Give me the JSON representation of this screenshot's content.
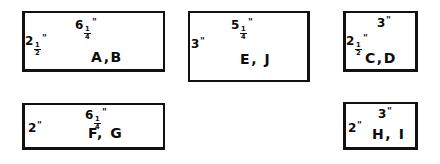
{
  "figure": {
    "ink_color": "#111111",
    "background_color": "#ffffff"
  },
  "rectangles": [
    {
      "id": "rect-ab",
      "names": "A,B",
      "top_label": {
        "whole": "6",
        "num": "1",
        "den": "4",
        "unit": "\""
      },
      "left_label": {
        "whole": "2",
        "num": "1",
        "den": "2",
        "unit": "\""
      },
      "width_in": 6.25,
      "height_in": 2.5
    },
    {
      "id": "rect-ej",
      "names": "E, J",
      "top_label": {
        "whole": "5",
        "num": "1",
        "den": "4",
        "unit": "\""
      },
      "left_label": {
        "whole": "3",
        "num": "",
        "den": "",
        "unit": "\""
      },
      "width_in": 5.25,
      "height_in": 3
    },
    {
      "id": "rect-cd",
      "names": "C,D",
      "top_label": {
        "whole": "3",
        "num": "",
        "den": "",
        "unit": "\""
      },
      "left_label": {
        "whole": "2",
        "num": "1",
        "den": "2",
        "unit": "\""
      },
      "width_in": 3,
      "height_in": 2.5
    },
    {
      "id": "rect-fg",
      "names": "F, G",
      "top_label": {
        "whole": "6",
        "num": "1",
        "den": "4",
        "unit": "\""
      },
      "left_label": {
        "whole": "2",
        "num": "",
        "den": "",
        "unit": "\""
      },
      "width_in": 6.25,
      "height_in": 2
    },
    {
      "id": "rect-hi",
      "names": "H, I",
      "top_label": {
        "whole": "3",
        "num": "",
        "den": "",
        "unit": "\""
      },
      "left_label": {
        "whole": "2",
        "num": "",
        "den": "",
        "unit": "\""
      },
      "width_in": 3,
      "height_in": 2
    }
  ]
}
